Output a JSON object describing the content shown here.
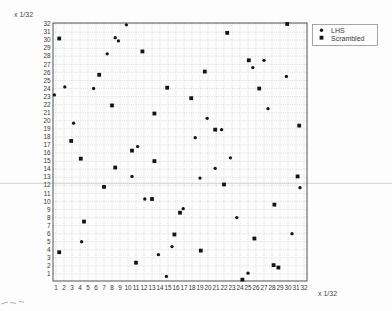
{
  "figure": {
    "y_axis_unit_label": "x 1/32",
    "x_axis_unit_label": "x 1/32"
  },
  "legend": {
    "items": [
      {
        "label": "LHS",
        "marker": "circle"
      },
      {
        "label": "Scrambled",
        "marker": "square"
      }
    ]
  },
  "chart_data": {
    "type": "scatter",
    "title": "",
    "xlabel": "x 1/32",
    "ylabel": "x 1/32",
    "xlim": [
      0.6,
      32.4
    ],
    "ylim": [
      0.1,
      32.1
    ],
    "x_tick_min": 1,
    "x_tick_max": 32,
    "y_tick_min": 1,
    "y_tick_max": 32,
    "grid": "dotted",
    "legend_position": "outside-upper-right",
    "marker_color": "#141414",
    "series": [
      {
        "name": "LHS",
        "marker": "circle",
        "points": [
          [
            9.8,
            31.9
          ],
          [
            8.4,
            30.3
          ],
          [
            8.8,
            29.9
          ],
          [
            7.4,
            28.3
          ],
          [
            27.0,
            27.5
          ],
          [
            25.6,
            26.6
          ],
          [
            29.8,
            25.5
          ],
          [
            2.1,
            24.2
          ],
          [
            5.7,
            24.0
          ],
          [
            0.8,
            23.2
          ],
          [
            27.5,
            21.5
          ],
          [
            19.9,
            20.3
          ],
          [
            3.2,
            19.7
          ],
          [
            21.7,
            18.9
          ],
          [
            18.4,
            17.9
          ],
          [
            11.2,
            16.8
          ],
          [
            22.8,
            15.4
          ],
          [
            20.9,
            14.1
          ],
          [
            10.5,
            13.1
          ],
          [
            19.0,
            12.9
          ],
          [
            31.5,
            11.7
          ],
          [
            12.1,
            10.3
          ],
          [
            16.9,
            9.1
          ],
          [
            23.6,
            8.0
          ],
          [
            30.5,
            6.0
          ],
          [
            4.2,
            5.0
          ],
          [
            15.5,
            4.4
          ],
          [
            13.8,
            3.4
          ],
          [
            25.0,
            1.1
          ],
          [
            14.8,
            0.7
          ]
        ]
      },
      {
        "name": "Scrambled",
        "marker": "square",
        "points": [
          [
            29.9,
            32.0
          ],
          [
            22.4,
            30.9
          ],
          [
            1.4,
            30.2
          ],
          [
            11.8,
            28.6
          ],
          [
            25.1,
            27.5
          ],
          [
            19.6,
            26.1
          ],
          [
            6.4,
            25.7
          ],
          [
            14.9,
            24.1
          ],
          [
            26.4,
            24.0
          ],
          [
            17.9,
            22.8
          ],
          [
            8.0,
            21.9
          ],
          [
            13.3,
            20.9
          ],
          [
            31.4,
            19.4
          ],
          [
            20.9,
            18.9
          ],
          [
            2.9,
            17.5
          ],
          [
            10.5,
            16.3
          ],
          [
            4.1,
            15.3
          ],
          [
            13.3,
            15.0
          ],
          [
            8.4,
            14.2
          ],
          [
            31.2,
            13.1
          ],
          [
            22.0,
            12.1
          ],
          [
            7.0,
            11.8
          ],
          [
            13.0,
            10.3
          ],
          [
            28.3,
            9.6
          ],
          [
            16.5,
            8.6
          ],
          [
            4.5,
            7.5
          ],
          [
            15.8,
            5.9
          ],
          [
            25.8,
            5.4
          ],
          [
            19.1,
            3.9
          ],
          [
            1.4,
            3.7
          ],
          [
            11.0,
            2.4
          ],
          [
            28.2,
            2.1
          ],
          [
            28.8,
            1.8
          ],
          [
            24.3,
            0.3
          ]
        ]
      }
    ]
  }
}
